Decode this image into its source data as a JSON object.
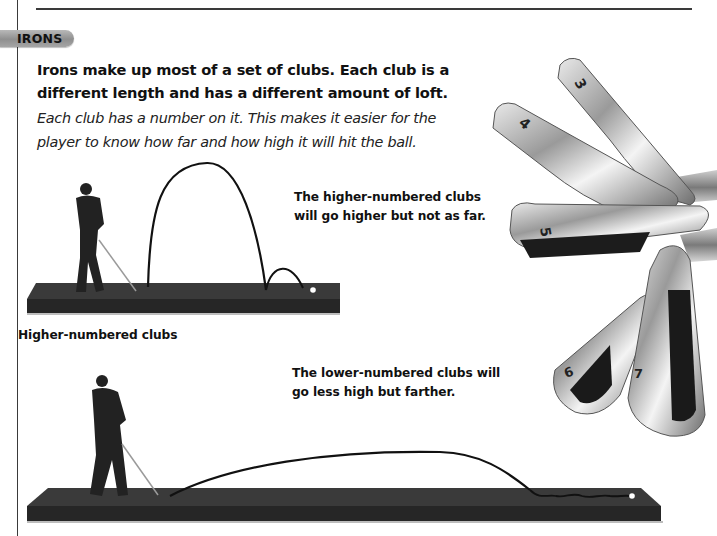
{
  "section": {
    "badge_label": "IRONS",
    "lead": "Irons make up most of a set of clubs. Each club is a different length and has a different amount of loft.",
    "body": "Each club has a number on it. This makes it easier for the player to know how far and how high it will hit the ball."
  },
  "illustrations": {
    "high_shot": {
      "caption": "The higher-numbered clubs will go higher but not as far.",
      "label": "Higher-numbered clubs"
    },
    "low_shot": {
      "caption": "The lower-numbered clubs will go less high but farther."
    },
    "clubs_photo": {
      "club_numbers": [
        "3",
        "4",
        "5",
        "6",
        "7"
      ]
    }
  },
  "colors": {
    "rule": "#3a3a3a",
    "badge": "#a3a3a3",
    "platform": "#2b2b2b",
    "text": "#111111"
  }
}
